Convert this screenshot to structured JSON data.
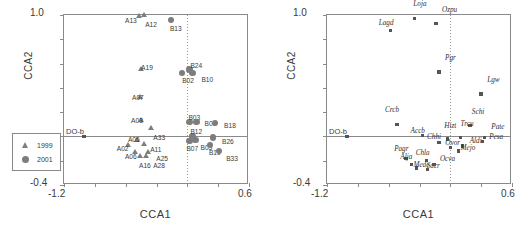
{
  "figure": {
    "axis_x_title": "CCA1",
    "axis_y_title": "CCA2",
    "x_min_label": "-1.2",
    "x_max_label": "0.6",
    "y_min_label": "-0.4",
    "y_max_label": "1.0",
    "marker_color": "#7d7d7d",
    "axis_color": "#8a8a8a"
  },
  "panel_a": {
    "letter": "a",
    "dissolved_oxygen_label": "DO-b",
    "legend": [
      {
        "symbol": "triangle",
        "label": "1999"
      },
      {
        "symbol": "circle",
        "label": "2001"
      }
    ]
  },
  "panel_b": {
    "letter": "b",
    "dissolved_oxygen_label": "DO-b"
  },
  "chart_data": [
    {
      "type": "scatter",
      "title": "a",
      "xlabel": "CCA1",
      "ylabel": "CCA2",
      "xlim": [
        -1.2,
        0.6
      ],
      "ylim": [
        -0.4,
        1.0
      ],
      "grid": false,
      "legend": [
        "1999",
        "2001"
      ],
      "legend_position": "lower-left",
      "series": [
        {
          "name": "1999",
          "marker": "triangle",
          "points": [
            {
              "label": "A13",
              "x": -0.47,
              "y": 0.97
            },
            {
              "label": "A12",
              "x": -0.42,
              "y": 0.98
            },
            {
              "label": "A19",
              "x": -0.45,
              "y": 0.53
            },
            {
              "label": "A07",
              "x": -0.46,
              "y": 0.3
            },
            {
              "label": "A03",
              "x": -0.45,
              "y": 0.11
            },
            {
              "label": "A33",
              "x": -0.35,
              "y": 0.05
            },
            {
              "label": "A05",
              "x": -0.49,
              "y": -0.05
            },
            {
              "label": "A02",
              "x": -0.57,
              "y": -0.09
            },
            {
              "label": "A11",
              "x": -0.42,
              "y": -0.08
            },
            {
              "label": "A06",
              "x": -0.51,
              "y": -0.15
            },
            {
              "label": "A25",
              "x": -0.38,
              "y": -0.15
            },
            {
              "label": "A16",
              "x": -0.46,
              "y": -0.18
            },
            {
              "label": "A28",
              "x": -0.4,
              "y": -0.18
            }
          ]
        },
        {
          "name": "2001",
          "marker": "circle",
          "points": [
            {
              "label": "B13",
              "x": -0.16,
              "y": 0.96
            },
            {
              "label": "B24",
              "x": 0.02,
              "y": 0.55
            },
            {
              "label": "B10",
              "x": 0.05,
              "y": 0.52
            },
            {
              "label": "B02",
              "x": -0.05,
              "y": 0.52
            },
            {
              "label": "B03",
              "x": 0.02,
              "y": 0.12
            },
            {
              "label": "B06",
              "x": 0.09,
              "y": 0.12
            },
            {
              "label": "B18",
              "x": 0.27,
              "y": 0.11
            },
            {
              "label": "B12",
              "x": 0.05,
              "y": 0.0
            },
            {
              "label": "B05",
              "x": 0.08,
              "y": -0.03
            },
            {
              "label": "B26",
              "x": 0.25,
              "y": -0.01
            },
            {
              "label": "B07",
              "x": 0.02,
              "y": -0.04
            },
            {
              "label": "B19",
              "x": 0.22,
              "y": -0.07
            },
            {
              "label": "B33",
              "x": 0.31,
              "y": -0.12
            }
          ]
        }
      ]
    },
    {
      "type": "scatter",
      "title": "b",
      "xlabel": "CCA1",
      "ylabel": "CCA2",
      "xlim": [
        -1.2,
        0.6
      ],
      "ylim": [
        -0.4,
        1.0
      ],
      "grid": false,
      "series": [
        {
          "name": "species scores",
          "marker": "square",
          "points": [
            {
              "label": "Lagd",
              "x": -0.58,
              "y": 0.87
            },
            {
              "label": "Loja",
              "x": -0.35,
              "y": 0.97
            },
            {
              "label": "Ozpu",
              "x": -0.14,
              "y": 0.93
            },
            {
              "label": "Pgr",
              "x": -0.11,
              "y": 0.53
            },
            {
              "label": "Lgw",
              "x": 0.3,
              "y": 0.35
            },
            {
              "label": "Crcb",
              "x": -0.52,
              "y": 0.1
            },
            {
              "label": "Schi",
              "x": 0.19,
              "y": 0.09
            },
            {
              "label": "Accb",
              "x": -0.27,
              "y": 0.01
            },
            {
              "label": "Chhi",
              "x": -0.11,
              "y": -0.05
            },
            {
              "label": "Hizt",
              "x": -0.03,
              "y": -0.02
            },
            {
              "label": "Trcu",
              "x": 0.1,
              "y": -0.01
            },
            {
              "label": "Pate",
              "x": 0.33,
              "y": -0.01
            },
            {
              "label": "Pesa",
              "x": 0.31,
              "y": -0.04
            },
            {
              "label": "Ovor",
              "x": 0.0,
              "y": -0.09
            },
            {
              "label": "Aldi",
              "x": 0.12,
              "y": -0.08
            },
            {
              "label": "Mejo",
              "x": 0.08,
              "y": -0.12
            },
            {
              "label": "Pagr",
              "x": -0.43,
              "y": -0.18
            },
            {
              "label": "Chla",
              "x": -0.23,
              "y": -0.2
            },
            {
              "label": "Alja",
              "x": -0.38,
              "y": -0.23
            },
            {
              "label": "Mede",
              "x": -0.33,
              "y": -0.26
            },
            {
              "label": "Sacr",
              "x": -0.22,
              "y": -0.27
            },
            {
              "label": "Ocva",
              "x": -0.16,
              "y": -0.23
            }
          ]
        }
      ]
    }
  ]
}
